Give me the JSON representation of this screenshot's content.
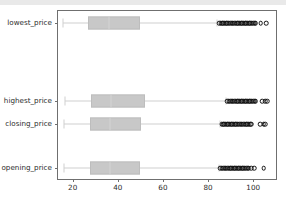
{
  "figure": {
    "background_color": "#ffffff",
    "topbar_color": "#e9e9e9",
    "frame_color": "#6f6f6f",
    "box_fill_color": "#c8c8c8",
    "box_edge_color": "#bdbdbd",
    "whisker_color": "#cfcfcf",
    "outlier_color": "#111111"
  },
  "chart_data": {
    "type": "box",
    "orientation": "horizontal",
    "title": "",
    "xlabel": "",
    "ylabel": "",
    "xlim": [
      13.5,
      111.0
    ],
    "grid": false,
    "legend": null,
    "xticks": [
      20,
      40,
      60,
      80,
      100
    ],
    "xticklabels": [
      "20",
      "40",
      "60",
      "80",
      "100"
    ],
    "categories": [
      "lowest_price",
      "highest_price",
      "closing_price",
      "opening_price"
    ],
    "boxes": [
      {
        "label": "lowest_price",
        "whisker_low": 15.5,
        "q1": 27.0,
        "median": 36.0,
        "q3": 50.0,
        "whisker_high": 84.0,
        "outliers": [
          85.0,
          85.6,
          86.2,
          86.8,
          87.4,
          88.0,
          88.6,
          89.2,
          89.8,
          90.4,
          91.0,
          91.6,
          92.2,
          92.8,
          93.4,
          94.0,
          94.6,
          95.2,
          95.8,
          96.4,
          97.0,
          97.6,
          98.2,
          98.8,
          99.4,
          100.0,
          100.6,
          101.2,
          103.4,
          105.8
        ]
      },
      {
        "label": "highest_price",
        "whisker_low": 16.5,
        "q1": 28.0,
        "median": 37.0,
        "q3": 52.0,
        "whisker_high": 88.0,
        "outliers": [
          88.6,
          89.2,
          89.8,
          90.4,
          91.0,
          91.6,
          92.2,
          92.8,
          93.4,
          94.0,
          94.6,
          95.2,
          95.8,
          96.4,
          97.0,
          97.6,
          98.2,
          98.8,
          99.4,
          100.0,
          100.6,
          101.2,
          104.0,
          105.4,
          106.2
        ]
      },
      {
        "label": "closing_price",
        "whisker_low": 16.0,
        "q1": 27.5,
        "median": 36.5,
        "q3": 50.5,
        "whisker_high": 85.5,
        "outliers": [
          86.0,
          86.6,
          87.2,
          87.8,
          88.4,
          89.0,
          89.6,
          90.2,
          90.8,
          91.4,
          92.0,
          92.6,
          93.2,
          93.8,
          94.4,
          95.0,
          95.6,
          96.2,
          96.8,
          97.4,
          98.0,
          98.6,
          99.2,
          103.0,
          104.6,
          105.4
        ]
      },
      {
        "label": "opening_price",
        "whisker_low": 16.0,
        "q1": 27.5,
        "median": 36.5,
        "q3": 50.0,
        "whisker_high": 85.0,
        "outliers": [
          85.5,
          86.1,
          86.7,
          87.3,
          87.9,
          88.5,
          89.1,
          89.7,
          90.3,
          90.9,
          91.5,
          92.1,
          92.7,
          93.3,
          93.9,
          94.5,
          95.1,
          95.7,
          96.3,
          96.9,
          97.5,
          98.1,
          99.2,
          100.4,
          104.6
        ]
      }
    ],
    "category_positions": [
      22,
      100,
      123,
      167
    ]
  }
}
